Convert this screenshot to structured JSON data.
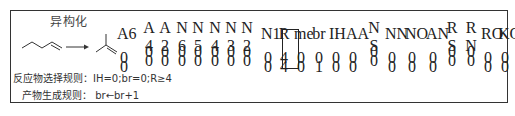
{
  "figure": {
    "title": "异构化",
    "reaction": {
      "reactant": "1-butene (skeletal)",
      "arrow": "→",
      "product": "isobutene (skeletal)"
    },
    "table": {
      "columns": [
        {
          "h1": "A6",
          "h2": ""
        },
        {
          "h1": "A",
          "h2": "4"
        },
        {
          "h1": "A",
          "h2": "2"
        },
        {
          "h1": "N",
          "h2": "6"
        },
        {
          "h1": "N",
          "h2": "5"
        },
        {
          "h1": "N",
          "h2": "4"
        },
        {
          "h1": "N",
          "h2": "3"
        },
        {
          "h1": "N",
          "h2": "2"
        },
        {
          "h1": "N1",
          "h2": ""
        },
        {
          "h1": "R",
          "h2": ""
        },
        {
          "h1": "me",
          "h2": ""
        },
        {
          "h1": "br",
          "h2": ""
        },
        {
          "h1": "IH",
          "h2": ""
        },
        {
          "h1": "AA",
          "h2": ""
        },
        {
          "h1": "N",
          "h2": "S"
        },
        {
          "h1": "NN",
          "h2": ""
        },
        {
          "h1": "NO",
          "h2": ""
        },
        {
          "h1": "AN",
          "h2": ""
        },
        {
          "h1": "R",
          "h2": "S"
        },
        {
          "h1": "R",
          "h2": "N"
        },
        {
          "h1": "RO",
          "h2": ""
        },
        {
          "h1": "KO",
          "h2": ""
        }
      ],
      "rows": [
        [
          "0",
          "0",
          "0",
          "0",
          "0",
          "0",
          "0",
          "0",
          "0",
          "4",
          "0",
          "0",
          "0",
          "0",
          "0",
          "0",
          "0",
          "0",
          "0",
          "0",
          "0",
          "0"
        ],
        [
          "0",
          "0",
          "0",
          "0",
          "0",
          "0",
          "0",
          "0",
          "0",
          "4",
          "0",
          "1",
          "0",
          "0",
          "0",
          "0",
          "0",
          "0",
          "0",
          "0",
          "0",
          "0"
        ]
      ],
      "highlighted_column": "br"
    },
    "reactant_rule": "反应物选择规则：IH=0;br=0;R≥4",
    "product_rule": "产物生成规则：  br←br+1"
  }
}
